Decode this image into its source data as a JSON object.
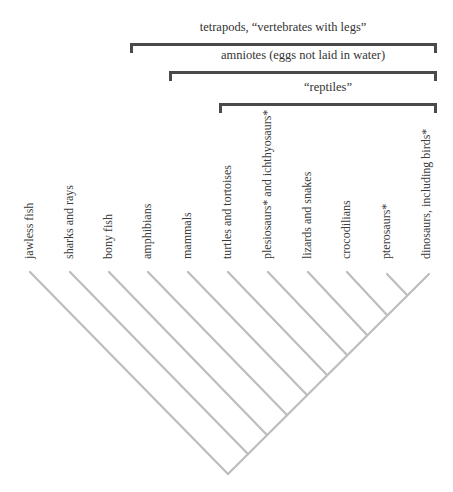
{
  "diagram": {
    "type": "cladogram",
    "brackets": [
      {
        "id": "tetrapods",
        "label": "tetrapods, “vertebrates with legs”",
        "x1": 130,
        "x2": 437,
        "y": 44
      },
      {
        "id": "amniotes",
        "label": "amniotes (eggs not laid in water)",
        "x1": 169,
        "x2": 437,
        "y": 72
      },
      {
        "id": "reptiles",
        "label": "“reptiles”",
        "x1": 219,
        "x2": 437,
        "y": 104
      }
    ],
    "taxa": [
      {
        "label": "jawless fish",
        "x": 30
      },
      {
        "label": "sharks and rays",
        "x": 70
      },
      {
        "label": "bony fish",
        "x": 109
      },
      {
        "label": "amphibians",
        "x": 148
      },
      {
        "label": "mammals",
        "x": 188
      },
      {
        "label": "turtles and tortoises",
        "x": 228
      },
      {
        "label": "plesiosaurs* and ichthyosaurs*",
        "x": 268
      },
      {
        "label": "lizards and snakes",
        "x": 308
      },
      {
        "label": "crocodilians",
        "x": 347
      },
      {
        "label": "pterosaurs*",
        "x": 387
      },
      {
        "label": "dinosaurs, including birds*",
        "x": 427
      }
    ],
    "tree": {
      "root": {
        "x": 228,
        "y": 474
      },
      "top_y": 272,
      "line_color": "#bdbdbd"
    },
    "bracket_color": "#4a4a4a"
  }
}
